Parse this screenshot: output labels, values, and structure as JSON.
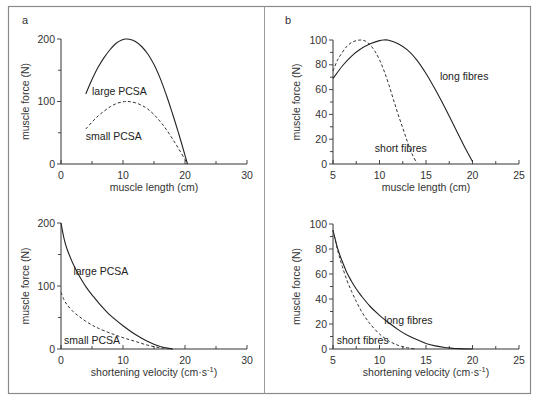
{
  "figure": {
    "colors": {
      "frame": "#8a8a8a",
      "ink": "#222222",
      "background": "#ffffff"
    }
  },
  "chart_data": [
    {
      "panel": "a",
      "type": "line",
      "title": "",
      "xlabel": "muscle length (cm)",
      "ylabel": "muscle force (N)",
      "xlim": [
        0,
        30
      ],
      "ylim": [
        0,
        200
      ],
      "xticks": [
        0,
        10,
        20,
        30
      ],
      "yticks": [
        0,
        100,
        200
      ],
      "grid": false,
      "series": [
        {
          "name": "large PCSA",
          "style": "solid",
          "x": [
            4,
            5,
            6,
            7,
            8,
            9,
            10,
            10.5,
            11,
            12,
            13,
            14,
            15,
            16,
            17,
            18,
            19,
            20,
            20.4
          ],
          "y": [
            112,
            135,
            155,
            171,
            184,
            194,
            199,
            200,
            199.5,
            196,
            188,
            176,
            159,
            137,
            110,
            80,
            48,
            14,
            0
          ]
        },
        {
          "name": "small PCSA",
          "style": "dashed",
          "x": [
            4,
            5,
            6,
            7,
            8,
            9,
            10,
            10.5,
            11,
            12,
            13,
            14,
            15,
            16,
            17,
            18,
            19,
            20,
            20.4
          ],
          "y": [
            56,
            67,
            77,
            85,
            92,
            97,
            99.5,
            100,
            99.8,
            98,
            94,
            88,
            79,
            68,
            55,
            40,
            24,
            7,
            0
          ]
        }
      ],
      "annotations": [
        {
          "text": "large PCSA",
          "x": 5,
          "y": 110
        },
        {
          "text": "small PCSA",
          "x": 4,
          "y": 38
        }
      ]
    },
    {
      "panel": "b",
      "type": "line",
      "title": "",
      "xlabel": "muscle length (cm)",
      "ylabel": "muscle force (N)",
      "xlim": [
        5,
        25
      ],
      "ylim": [
        0,
        100
      ],
      "xticks": [
        5,
        10,
        15,
        20,
        25
      ],
      "yticks": [
        0,
        20,
        40,
        60,
        80,
        100
      ],
      "grid": false,
      "series": [
        {
          "name": "long fibres",
          "style": "solid",
          "x": [
            5,
            6,
            7,
            8,
            9,
            10,
            10.5,
            11,
            12,
            13,
            14,
            15,
            16,
            17,
            18,
            19,
            20
          ],
          "y": [
            69,
            79,
            87,
            93,
            97,
            99.5,
            100,
            99.8,
            97,
            92,
            84,
            73,
            60,
            46,
            31,
            16,
            2
          ]
        },
        {
          "name": "short fibres",
          "style": "dashed",
          "x": [
            5,
            5.5,
            6,
            6.5,
            7,
            7.5,
            8,
            8.5,
            9,
            9.5,
            10,
            10.5,
            11,
            11.5,
            12,
            12.5,
            13,
            13.5,
            14
          ],
          "y": [
            75,
            84,
            90,
            95,
            98,
            99.5,
            100,
            99,
            96,
            91,
            84,
            75,
            64,
            52,
            40,
            29,
            18,
            8,
            1
          ]
        }
      ],
      "annotations": [
        {
          "text": "long fibres",
          "x": 16.5,
          "y": 68
        },
        {
          "text": "short fibres",
          "x": 9.5,
          "y": 10
        }
      ]
    },
    {
      "panel": "c",
      "type": "line",
      "title": "",
      "xlabel": "shortening velocity (cm·s⁻¹)",
      "ylabel": "muscle force (N)",
      "xlim": [
        0,
        30
      ],
      "ylim": [
        0,
        200
      ],
      "xticks": [
        0,
        10,
        20,
        30
      ],
      "yticks": [
        0,
        100,
        200
      ],
      "grid": false,
      "series": [
        {
          "name": "large PCSA",
          "style": "solid",
          "x": [
            0,
            0.5,
            1,
            2,
            3,
            4,
            5,
            6,
            7,
            8,
            10,
            12,
            14,
            16,
            18
          ],
          "y": [
            200,
            175,
            158,
            134,
            115,
            99,
            86,
            74,
            63,
            53,
            37,
            23,
            12,
            4,
            0
          ]
        },
        {
          "name": "small PCSA",
          "style": "dashed",
          "x": [
            0,
            0.5,
            1,
            2,
            3,
            4,
            5,
            6,
            8,
            10,
            12,
            14,
            16,
            18
          ],
          "y": [
            90,
            78,
            70,
            59,
            51,
            44,
            38,
            33,
            25,
            18,
            12,
            6,
            2,
            0
          ]
        }
      ],
      "annotations": [
        {
          "text": "large PCSA",
          "x": 2,
          "y": 118
        },
        {
          "text": "small PCSA",
          "x": 0.5,
          "y": 8
        }
      ]
    },
    {
      "panel": "d",
      "type": "line",
      "title": "",
      "xlabel": "shortening velocity (cm·s⁻¹)",
      "ylabel": "muscle force (N)",
      "xlim": [
        5,
        25
      ],
      "ylim": [
        0,
        100
      ],
      "xticks": [
        5,
        10,
        15,
        20,
        25
      ],
      "yticks": [
        0,
        20,
        40,
        60,
        80,
        100
      ],
      "grid": false,
      "series": [
        {
          "name": "long fibres",
          "style": "solid",
          "x": [
            5,
            5.3,
            5.6,
            6,
            6.5,
            7,
            7.5,
            8,
            9,
            10,
            11,
            12,
            13,
            14,
            15,
            16,
            17,
            18,
            19,
            20
          ],
          "y": [
            95,
            86,
            78,
            70,
            61,
            54,
            48,
            43,
            34,
            27,
            21,
            15.5,
            11,
            7.5,
            4.5,
            2.5,
            1.2,
            0.5,
            0.1,
            0
          ]
        },
        {
          "name": "short fibres",
          "style": "dashed",
          "x": [
            5,
            5.3,
            5.6,
            6,
            6.5,
            7,
            7.5,
            8,
            8.5,
            9,
            10,
            11,
            12,
            13,
            14
          ],
          "y": [
            95,
            85,
            76,
            66,
            55,
            46,
            38,
            31,
            25,
            20,
            12,
            6.5,
            3,
            1,
            0
          ]
        }
      ],
      "annotations": [
        {
          "text": "long fibres",
          "x": 10.5,
          "y": 20
        },
        {
          "text": "short fibres",
          "x": 5.4,
          "y": 4
        }
      ]
    }
  ]
}
